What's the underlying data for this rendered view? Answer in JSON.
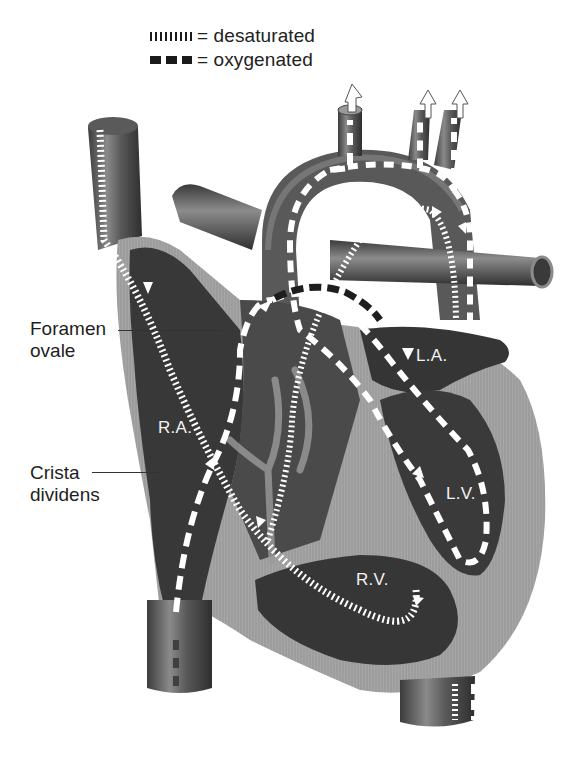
{
  "legend": {
    "desaturated": {
      "symbol": "dotted-line",
      "label": "= desaturated"
    },
    "oxygenated": {
      "symbol": "dashed-line",
      "label": "= oxygenated"
    }
  },
  "callouts": {
    "foramen_ovale": {
      "line1": "Foramen",
      "line2": "ovale"
    },
    "crista_dividens": {
      "line1": "Crista",
      "line2": "dividens"
    }
  },
  "chambers": {
    "ra": "R.A.",
    "la": "L.A.",
    "lv": "L.V.",
    "rv": "R.V."
  },
  "colors": {
    "tissue_dark": "#3a3a3a",
    "tissue_mid": "#6b6b6b",
    "wall_light": "#a8a8a8",
    "flow_marker": "#ffffff",
    "background": "#ffffff"
  }
}
